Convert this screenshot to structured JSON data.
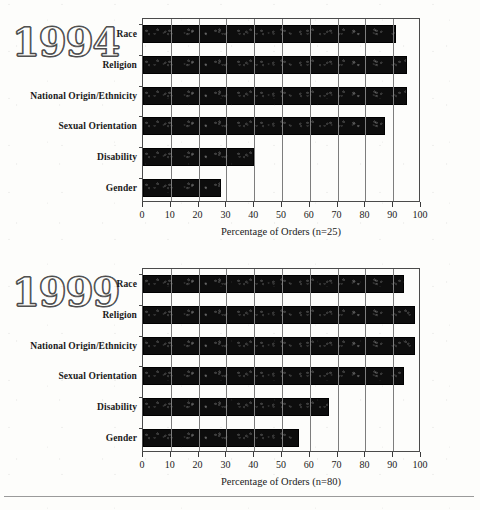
{
  "page": {
    "background_color": "#fdfdfb",
    "bar_color": "#0d0d0d",
    "axis_color": "#3a3a3a",
    "grid_color": "#7d7d7d"
  },
  "charts": [
    {
      "year_badge": "1994",
      "axis_title": "Percentage of Orders (n=25)",
      "chart_data": {
        "type": "bar",
        "orientation": "horizontal",
        "title": "1994",
        "xlabel": "Percentage of Orders (n=25)",
        "ylabel": "",
        "xlim": [
          0,
          100
        ],
        "ylim": null,
        "grid": true,
        "legend": null,
        "n": 25,
        "categories": [
          "Race",
          "Religion",
          "National Origin/Ethnicity",
          "Sexual Orientation",
          "Disability",
          "Gender"
        ],
        "values": [
          91,
          95,
          95,
          87,
          40,
          28
        ],
        "xticks": [
          0,
          10,
          20,
          30,
          40,
          50,
          60,
          70,
          80,
          90,
          100
        ],
        "xticklabels": [
          "0",
          "10",
          "20",
          "30",
          "40",
          "50",
          "60",
          "70",
          "80",
          "90",
          "100"
        ]
      }
    },
    {
      "year_badge": "1999",
      "axis_title": "Percentage of Orders (n=80)",
      "chart_data": {
        "type": "bar",
        "orientation": "horizontal",
        "title": "1999",
        "xlabel": "Percentage of Orders (n=80)",
        "ylabel": "",
        "xlim": [
          0,
          100
        ],
        "ylim": null,
        "grid": true,
        "legend": null,
        "n": 80,
        "categories": [
          "Race",
          "Religion",
          "National Origin/Ethnicity",
          "Sexual Orientation",
          "Disability",
          "Gender"
        ],
        "values": [
          94,
          98,
          98,
          94,
          67,
          56
        ],
        "xticks": [
          0,
          10,
          20,
          30,
          40,
          50,
          60,
          70,
          80,
          90,
          100
        ],
        "xticklabels": [
          "0",
          "10",
          "20",
          "30",
          "40",
          "50",
          "60",
          "70",
          "80",
          "90",
          "100"
        ]
      }
    }
  ]
}
